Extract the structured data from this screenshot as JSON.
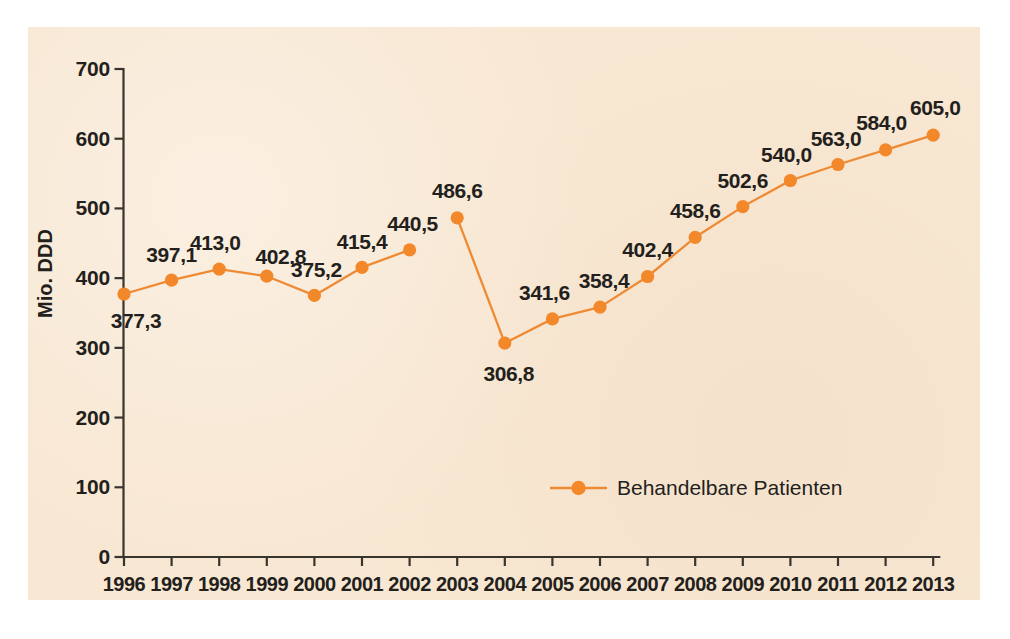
{
  "chart_data": {
    "type": "line",
    "title": "",
    "xlabel": "",
    "ylabel": "Mio. DDD",
    "ylim": [
      0,
      700
    ],
    "yticks": [
      0,
      100,
      200,
      300,
      400,
      500,
      600,
      700
    ],
    "grid": false,
    "legend_position": "inside-bottom-center",
    "line_color": "#ee8a33",
    "marker_color": "#f3882b",
    "background_color": "#f8e7d2",
    "text_color": "#231f1c",
    "axis_color": "#3a342f",
    "categories": [
      "1996",
      "1997",
      "1998",
      "1999",
      "2000",
      "2001",
      "2002",
      "2003",
      "2004",
      "2005",
      "2006",
      "2007",
      "2008",
      "2009",
      "2010",
      "2011",
      "2012",
      "2013"
    ],
    "series": [
      {
        "name": "Behandelbare Patienten",
        "values": [
          377.3,
          397.1,
          413.0,
          402.8,
          375.2,
          415.4,
          440.5,
          486.6,
          306.8,
          341.6,
          358.4,
          402.4,
          458.6,
          502.6,
          540.0,
          563.0,
          584.0,
          605.0
        ],
        "value_labels": [
          "377,3",
          "397,1",
          "413,0",
          "402,8",
          "375,2",
          "415,4",
          "440,5",
          "486,6",
          "306,8",
          "341,6",
          "358,4",
          "402,4",
          "458,6",
          "502,6",
          "540,0",
          "563,0",
          "584,0",
          "605,0"
        ],
        "label_positions": [
          "below",
          "above",
          "above",
          "above",
          "above",
          "above",
          "above",
          "above",
          "below",
          "above",
          "above",
          "above",
          "above",
          "above",
          "above",
          "above",
          "above",
          "above"
        ],
        "line_break_after_index": 7
      }
    ],
    "ytick_labels": [
      "0",
      "100",
      "200",
      "300",
      "400",
      "500",
      "600",
      "700"
    ],
    "legend": [
      {
        "label": "Behandelbare Patienten",
        "color": "#f3882b",
        "marker": "circle"
      }
    ]
  }
}
